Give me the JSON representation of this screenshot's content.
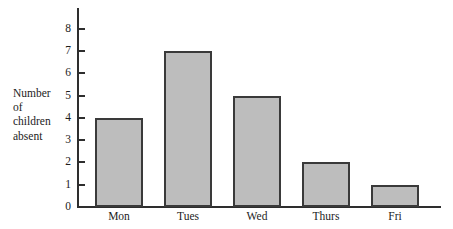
{
  "chart_data": {
    "type": "bar",
    "title": "",
    "xlabel": "",
    "ylabel": "Number of children absent",
    "ylabel_lines": [
      "Number",
      "of",
      "children",
      "absent"
    ],
    "categories": [
      "Mon",
      "Tues",
      "Wed",
      "Thurs",
      "Fri"
    ],
    "values": [
      4,
      7,
      5,
      2,
      1
    ],
    "ylim": [
      0,
      8
    ],
    "ytick_labels": [
      "0",
      "1",
      "2",
      "3",
      "4",
      "5",
      "6",
      "7",
      "8"
    ],
    "ytick_values": [
      0,
      1,
      2,
      3,
      4,
      5,
      6,
      7,
      8
    ],
    "grid": false,
    "legend": false,
    "bar_fill_color": "#bdbdbd",
    "bar_edge_color": "#3a3a3a",
    "axis_color": "#2e2e2e",
    "background_color": "#ffffff"
  }
}
